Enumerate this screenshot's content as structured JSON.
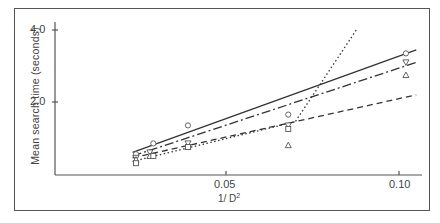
{
  "chart_data": {
    "type": "scatter",
    "title": "",
    "xlabel": "1/D²",
    "xlabel_base": "1/ D",
    "xlabel_sup": "2",
    "ylabel": "Mean search time (seconds)",
    "xlim": [
      0.0,
      0.108
    ],
    "ylim": [
      0.0,
      4.3
    ],
    "x_ticks": [
      "0.05",
      "0.10"
    ],
    "y_ticks": [
      "2.0",
      "4.0"
    ],
    "grid": false,
    "legend": null,
    "series": [
      {
        "name": "circle",
        "marker": "circle",
        "line": "solid",
        "points": [
          [
            0.024,
            0.55
          ],
          [
            0.029,
            0.85
          ],
          [
            0.039,
            1.35
          ],
          [
            0.068,
            1.65
          ],
          [
            0.102,
            3.35
          ]
        ],
        "fit": [
          [
            0.023,
            0.6
          ],
          [
            0.105,
            3.45
          ]
        ]
      },
      {
        "name": "inverted-triangle",
        "marker": "triangle-down",
        "line": "dash-dot",
        "points": [
          [
            0.024,
            0.45
          ],
          [
            0.028,
            0.6
          ],
          [
            0.039,
            0.85
          ],
          [
            0.068,
            1.35
          ],
          [
            0.102,
            3.1
          ]
        ],
        "fit": [
          [
            0.023,
            0.5
          ],
          [
            0.105,
            3.1
          ]
        ]
      },
      {
        "name": "triangle",
        "marker": "triangle-up",
        "line": "dashed",
        "points": [
          [
            0.024,
            0.4
          ],
          [
            0.028,
            0.5
          ],
          [
            0.039,
            0.75
          ],
          [
            0.068,
            0.8
          ],
          [
            0.102,
            2.75
          ]
        ],
        "fit": [
          [
            0.023,
            0.45
          ],
          [
            0.105,
            2.2
          ]
        ]
      },
      {
        "name": "square",
        "marker": "square",
        "line": "dotted",
        "points": [
          [
            0.024,
            0.3
          ],
          [
            0.029,
            0.5
          ],
          [
            0.039,
            0.75
          ],
          [
            0.068,
            1.25
          ]
        ],
        "fit": [
          [
            0.023,
            0.35
          ],
          [
            0.07,
            1.45
          ],
          [
            0.088,
            4.05
          ]
        ]
      }
    ]
  }
}
